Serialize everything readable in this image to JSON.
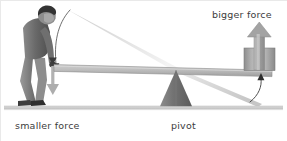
{
  "figure": {
    "background_color": "#ffffff",
    "labels": {
      "smaller_force": "smaller force",
      "pivot": "pivot",
      "bigger_force": "bigger force"
    },
    "colors": {
      "text": "#3c3c3c",
      "ground": "#c9c9c9",
      "lever_fill": "#b4b4b4",
      "lever_edge": "#8f8f8f",
      "pivot_fill": "#6e6e6e",
      "arrow_gray": "#9a9a9a",
      "block_fill": "#a8a8a8",
      "motion_trail": "#d8d8d8",
      "person_dark": "#555555",
      "person_mid": "#7a7a7a",
      "person_light": "#9c9c9c"
    },
    "elements": {
      "ground_label": "ground-line",
      "lever_label": "lever-beam",
      "pivot_label": "pivot-triangle",
      "load_label": "load-block",
      "effort_arrow_label": "downward-force-arrow",
      "load_arrow_label": "upward-force-arrow",
      "person_label": "person-pushing-lever",
      "left_trail_label": "left-motion-trail",
      "right_trail_label": "right-motion-trail",
      "left_arc_label": "left-motion-arc",
      "right_arc_label": "right-motion-arc"
    }
  }
}
